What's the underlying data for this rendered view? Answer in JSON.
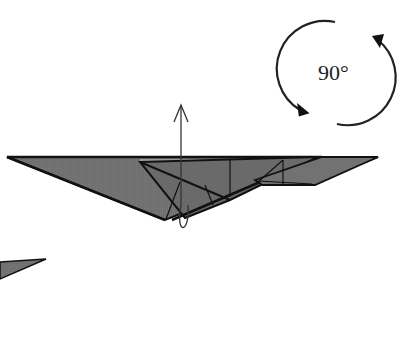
{
  "diagram": {
    "type": "origami-fold-step",
    "rotation_symbol": {
      "label": "90°",
      "direction": "rotate"
    },
    "fill_color": "#6e6e6e",
    "line_color": "#111111",
    "arrows": [
      {
        "kind": "lift-up-arrow",
        "description": "vertical arrow pointing up with looping tail"
      }
    ]
  }
}
